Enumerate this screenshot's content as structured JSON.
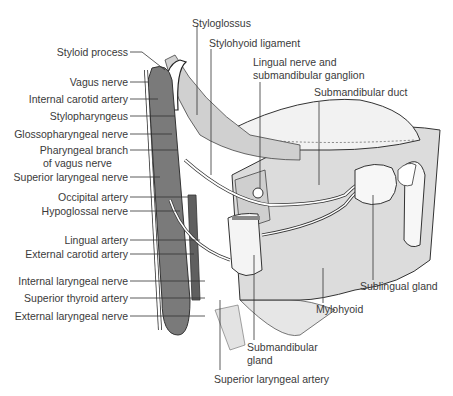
{
  "figure": {
    "left_labels": [
      {
        "text": "Styloid process",
        "y": 52
      },
      {
        "text": "Vagus nerve",
        "y": 82
      },
      {
        "text": "Internal carotid artery",
        "y": 99
      },
      {
        "text": "Stylopharyngeus",
        "y": 116
      },
      {
        "text": "Glossopharyngeal nerve",
        "y": 134
      },
      {
        "text": "Pharyngeal branch",
        "y": 150
      },
      {
        "text": "of vagus nerve",
        "y": 163
      },
      {
        "text": "Superior laryngeal nerve",
        "y": 177
      },
      {
        "text": "Occipital artery",
        "y": 197
      },
      {
        "text": "Hypoglossal nerve",
        "y": 211
      },
      {
        "text": "Lingual artery",
        "y": 240
      },
      {
        "text": "External carotid artery",
        "y": 254
      },
      {
        "text": "Internal laryngeal nerve",
        "y": 281
      },
      {
        "text": "Superior thyroid artery",
        "y": 298
      },
      {
        "text": "External laryngeal nerve",
        "y": 316
      }
    ],
    "top_labels": {
      "styloglossus": "Styloglossus",
      "stylohyoid": "Stylohyoid ligament",
      "lingual_1": "Lingual nerve and",
      "lingual_2": "submandibular ganglion",
      "duct": "Submandibular duct"
    },
    "bottom_labels": {
      "sublingual": "Sublingual gland",
      "mylohyoid": "Mylohyoid",
      "submand_1": "Submandibular",
      "submand_2": "gland",
      "sup_laryngeal_artery": "Superior laryngeal artery"
    },
    "colors": {
      "line": "#333333",
      "muscle": "#d9d9d9",
      "vessel": "#7a7a7a",
      "vessel_dark": "#5f5f5f"
    }
  }
}
